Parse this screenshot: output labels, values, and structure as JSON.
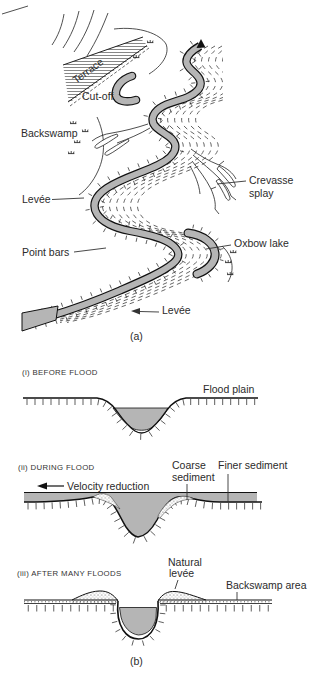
{
  "figure": {
    "a": {
      "caption": "(a)",
      "terrace": "Terrace",
      "cutoff": "Cut-off",
      "backswamp": "Backswamp",
      "levee_left": "Levée",
      "point_bars": "Point bars",
      "crevasse_line1": "Crevasse",
      "crevasse_line2": "splay",
      "oxbow": "Oxbow lake",
      "levee_bottom": "Levée"
    },
    "b": {
      "caption": "(b)",
      "s1": {
        "heading": "(i) BEFORE FLOOD",
        "flood_plain": "Flood plain"
      },
      "s2": {
        "heading": "(ii) DURING FLOOD",
        "velocity": "Velocity reduction",
        "coarse_line1": "Coarse",
        "coarse_line2": "sediment",
        "finer": "Finer sediment"
      },
      "s3": {
        "heading": "(iii) AFTER MANY FLOODS",
        "natural_line1": "Natural",
        "natural_line2": "levée",
        "backswamp_area": "Backswamp area"
      }
    },
    "colors": {
      "water": "#b5b5b5",
      "ink": "#1f1f1f",
      "label": "#2b2b2b",
      "background": "#ffffff"
    }
  }
}
